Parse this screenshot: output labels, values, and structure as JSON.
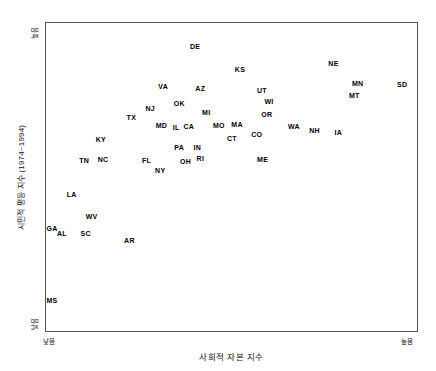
{
  "chart_data": {
    "type": "scatter",
    "title": "",
    "xlabel": "사회적 자본 지수",
    "ylabel": "시민적 평등 지수 (1974~1994)",
    "xlim": [
      0,
      100
    ],
    "ylim": [
      0,
      100
    ],
    "grid": false,
    "legend": null,
    "axis_tick_labels": {
      "x_low": "낮음",
      "x_high": "높음",
      "y_low": "낮음",
      "y_high": "높음"
    },
    "point_label_mode": "text-only",
    "points": [
      {
        "label": "DE",
        "x": 40.2,
        "y": 92.6
      },
      {
        "label": "NE",
        "x": 77.5,
        "y": 87.1
      },
      {
        "label": "KS",
        "x": 52.3,
        "y": 85.2
      },
      {
        "label": "VA",
        "x": 31.6,
        "y": 79.4
      },
      {
        "label": "AZ",
        "x": 41.6,
        "y": 79.0
      },
      {
        "label": "UT",
        "x": 58.2,
        "y": 78.1
      },
      {
        "label": "MN",
        "x": 84.0,
        "y": 80.6
      },
      {
        "label": "SD",
        "x": 96.0,
        "y": 80.3
      },
      {
        "label": "MT",
        "x": 83.1,
        "y": 76.5
      },
      {
        "label": "WI",
        "x": 60.1,
        "y": 74.8
      },
      {
        "label": "OK",
        "x": 35.9,
        "y": 73.9
      },
      {
        "label": "NJ",
        "x": 28.1,
        "y": 72.3
      },
      {
        "label": "MI",
        "x": 43.2,
        "y": 71.0
      },
      {
        "label": "TX",
        "x": 23.0,
        "y": 69.4
      },
      {
        "label": "OR",
        "x": 59.5,
        "y": 70.3
      },
      {
        "label": "MD",
        "x": 31.1,
        "y": 66.8
      },
      {
        "label": "IL",
        "x": 35.1,
        "y": 66.1
      },
      {
        "label": "CA",
        "x": 38.5,
        "y": 66.5
      },
      {
        "label": "MO",
        "x": 46.6,
        "y": 66.8
      },
      {
        "label": "MA",
        "x": 51.5,
        "y": 67.1
      },
      {
        "label": "WA",
        "x": 66.8,
        "y": 66.5
      },
      {
        "label": "NH",
        "x": 72.4,
        "y": 65.2
      },
      {
        "label": "IA",
        "x": 78.8,
        "y": 64.5
      },
      {
        "label": "CO",
        "x": 56.8,
        "y": 63.9
      },
      {
        "label": "CT",
        "x": 50.1,
        "y": 62.6
      },
      {
        "label": "KY",
        "x": 14.8,
        "y": 62.3
      },
      {
        "label": "PA",
        "x": 35.9,
        "y": 59.7
      },
      {
        "label": "IN",
        "x": 40.8,
        "y": 59.7
      },
      {
        "label": "TN",
        "x": 10.3,
        "y": 55.5
      },
      {
        "label": "NC",
        "x": 15.4,
        "y": 55.8
      },
      {
        "label": "FL",
        "x": 27.1,
        "y": 55.5
      },
      {
        "label": "OH",
        "x": 37.6,
        "y": 55.2
      },
      {
        "label": "RI",
        "x": 41.6,
        "y": 56.1
      },
      {
        "label": "ME",
        "x": 58.4,
        "y": 55.8
      },
      {
        "label": "NY",
        "x": 30.8,
        "y": 52.3
      },
      {
        "label": "LA",
        "x": 6.9,
        "y": 44.5
      },
      {
        "label": "WV",
        "x": 12.3,
        "y": 37.4
      },
      {
        "label": "GA",
        "x": 1.6,
        "y": 33.5
      },
      {
        "label": "AL",
        "x": 4.3,
        "y": 31.9
      },
      {
        "label": "SC",
        "x": 10.7,
        "y": 31.9
      },
      {
        "label": "AR",
        "x": 22.5,
        "y": 29.7
      },
      {
        "label": "MS",
        "x": 1.6,
        "y": 10.0
      }
    ]
  }
}
